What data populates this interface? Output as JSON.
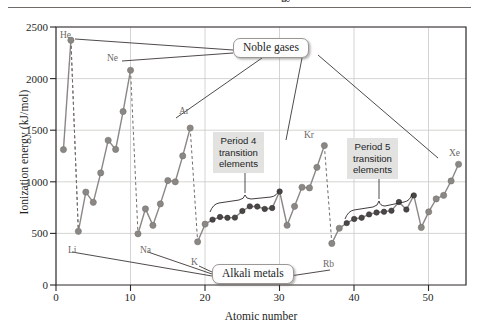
{
  "figure": {
    "title_fragment": "Ionization Energy",
    "top_rule": "horizontal-rule"
  },
  "axes": {
    "y_title": "Ionization energy (kJ/mol)",
    "x_title": "Atomic number",
    "y_ticks": [
      "0",
      "500",
      "1000",
      "1500",
      "2000",
      "2500"
    ],
    "x_ticks": [
      "0",
      "10",
      "20",
      "30",
      "40",
      "50"
    ]
  },
  "callouts": [
    {
      "id": "noble-gases",
      "label": "Noble gases"
    },
    {
      "id": "alkali-metals",
      "label": "Alkali metals"
    }
  ],
  "shaded_labels": [
    {
      "id": "period-4",
      "line1": "Period 4",
      "line2": "transition",
      "line3": "elements"
    },
    {
      "id": "period-5",
      "line1": "Period 5",
      "line2": "transition",
      "line3": "elements"
    }
  ],
  "point_labels": [
    {
      "symbol": "He",
      "z": 2
    },
    {
      "symbol": "Ne",
      "z": 10
    },
    {
      "symbol": "Ar",
      "z": 18
    },
    {
      "symbol": "Kr",
      "z": 36
    },
    {
      "symbol": "Xe",
      "z": 54
    },
    {
      "symbol": "Li",
      "z": 3
    },
    {
      "symbol": "Na",
      "z": 11
    },
    {
      "symbol": "K",
      "z": 19
    },
    {
      "symbol": "Rb",
      "z": 37
    }
  ],
  "colors": {
    "main_point": "#8b8785",
    "transition_point": "#4a4746",
    "line": "#8b8785",
    "dashed": "#6f6c6a",
    "grid": "#c9c9c8",
    "axis": "#2b2726",
    "label_text": "#6d6966",
    "shade_bg": "#e2e2e1"
  },
  "chart_data": {
    "type": "line",
    "title": "Ionization Energy",
    "xlabel": "Atomic number",
    "ylabel": "Ionization energy (kJ/mol)",
    "xlim": [
      0,
      55
    ],
    "ylim": [
      0,
      2500
    ],
    "grid": true,
    "legend": "none",
    "x": [
      1,
      2,
      3,
      4,
      5,
      6,
      7,
      8,
      9,
      10,
      11,
      12,
      13,
      14,
      15,
      16,
      17,
      18,
      19,
      20,
      21,
      22,
      23,
      24,
      25,
      26,
      27,
      28,
      29,
      30,
      31,
      32,
      33,
      34,
      35,
      36,
      37,
      38,
      39,
      40,
      41,
      42,
      43,
      44,
      45,
      46,
      47,
      48,
      49,
      50,
      51,
      52,
      53,
      54
    ],
    "values": [
      1312,
      2372,
      520,
      900,
      801,
      1086,
      1402,
      1314,
      1681,
      2081,
      496,
      738,
      578,
      786,
      1012,
      1000,
      1251,
      1521,
      419,
      590,
      633,
      659,
      651,
      653,
      717,
      762,
      760,
      737,
      746,
      906,
      579,
      762,
      947,
      941,
      1140,
      1351,
      403,
      550,
      600,
      640,
      652,
      684,
      702,
      710,
      720,
      804,
      731,
      868,
      558,
      709,
      834,
      869,
      1008,
      1170
    ],
    "annotations": {
      "noble_gases": [
        2,
        10,
        18,
        36,
        54
      ],
      "alkali_metals": [
        3,
        11,
        19,
        37
      ],
      "period_4_transition": [
        21,
        22,
        23,
        24,
        25,
        26,
        27,
        28,
        29,
        30
      ],
      "period_5_transition": [
        39,
        40,
        41,
        42,
        43,
        44,
        45,
        46,
        47,
        48
      ]
    },
    "labeled_points": [
      {
        "symbol": "He",
        "x": 2,
        "y": 2372
      },
      {
        "symbol": "Ne",
        "x": 10,
        "y": 2081
      },
      {
        "symbol": "Ar",
        "x": 18,
        "y": 1521
      },
      {
        "symbol": "Kr",
        "x": 36,
        "y": 1351
      },
      {
        "symbol": "Xe",
        "x": 54,
        "y": 1170
      },
      {
        "symbol": "Li",
        "x": 3,
        "y": 520
      },
      {
        "symbol": "Na",
        "x": 11,
        "y": 496
      },
      {
        "symbol": "K",
        "x": 19,
        "y": 419
      },
      {
        "symbol": "Rb",
        "x": 37,
        "y": 403
      }
    ]
  }
}
